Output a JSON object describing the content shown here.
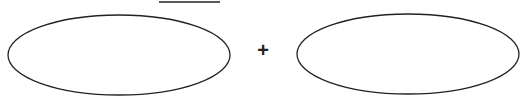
{
  "diagram": {
    "operator": "+",
    "shapes": [
      {
        "type": "ellipse",
        "label": "left-blank",
        "cx": 119,
        "cy": 54,
        "rx": 111,
        "ry": 40
      },
      {
        "type": "ellipse",
        "label": "right-blank",
        "cx": 408,
        "cy": 54,
        "rx": 111,
        "ry": 40
      }
    ],
    "top_line": {
      "x1": 159,
      "x2": 220,
      "y": 2
    },
    "stroke_color": "#222222"
  }
}
